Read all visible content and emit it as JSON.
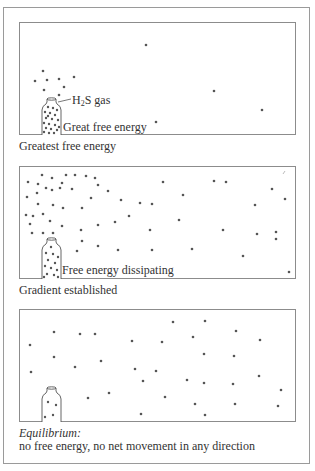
{
  "figure": {
    "panels": [
      {
        "id": "panel-1",
        "bottle_label_prefix": "H",
        "bottle_label_sub": "2",
        "bottle_label_suffix": "S gas",
        "inner_label": "Great free energy",
        "caption": "Greatest free energy",
        "bottle_state": "full"
      },
      {
        "id": "panel-2",
        "inner_label": "Free energy dissipating",
        "caption": "Gradient established",
        "bottle_state": "partially-full"
      },
      {
        "id": "panel-3",
        "caption_italic": "Equilibrium:",
        "caption": "no free energy, no net movement in any direction",
        "bottle_state": "nearly-empty"
      }
    ],
    "colors": {
      "border": "#8c8c8c",
      "dot": "#555555",
      "text": "#333333"
    }
  }
}
